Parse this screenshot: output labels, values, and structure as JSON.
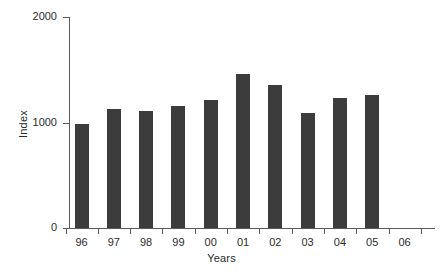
{
  "chart_data": {
    "type": "bar",
    "title": "",
    "subtitle": "",
    "xlabel": "Years",
    "ylabel": "Index",
    "categories": [
      "96",
      "97",
      "98",
      "99",
      "00",
      "01",
      "02",
      "03",
      "04",
      "05",
      "06"
    ],
    "values": [
      990,
      1125,
      1105,
      1155,
      1210,
      1455,
      1360,
      1090,
      1230,
      1260,
      null
    ],
    "ylim": [
      0,
      2000
    ],
    "y_ticks": [
      0,
      1000,
      2000
    ],
    "y_tick_labels": [
      "0",
      "1000",
      "2000"
    ],
    "grid": false,
    "legend": false,
    "legend_position": "none",
    "bar_color": "#3c3c3c",
    "axis_color": "#5a5a5a",
    "text_color": "#2b2b2b",
    "background_color": "#ffffff"
  }
}
